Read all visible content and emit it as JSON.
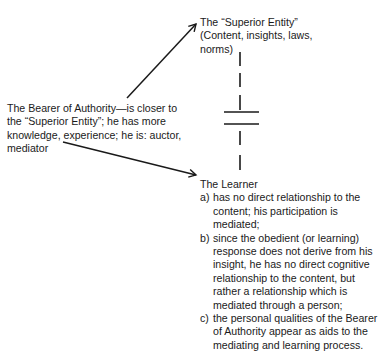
{
  "superior_entity": {
    "lines": [
      "The “Superior Entity”",
      "(Content, insights, laws,",
      "norms)"
    ]
  },
  "bearer_of_authority": {
    "lines": [
      "The Bearer of Authority—is closer to",
      "the “Superior Entity”; he has more",
      "knowledge, experience; he is: auctor,",
      "mediator"
    ]
  },
  "learner": {
    "title": "The Learner",
    "items": [
      {
        "label": "a)",
        "lines": [
          "has no direct relationship to the",
          "content; his participation is",
          "mediated;"
        ]
      },
      {
        "label": "b)",
        "lines": [
          "since the obedient (or learning)",
          "response does not derive from his",
          "insight, he has no direct cognitive",
          "relationship to the content, but",
          "rather a relationship which is",
          "mediated through a person;"
        ]
      },
      {
        "label": "c)",
        "lines": [
          "the personal qualities of the Bearer",
          "of Authority appear as aids to the",
          "mediating and learning process."
        ]
      }
    ]
  },
  "connectors": {
    "arrow_bearer_to_superior": "arrow",
    "arrow_bearer_to_learner": "arrow",
    "dashed_link_superior_learner": "dashed line with break symbol"
  }
}
